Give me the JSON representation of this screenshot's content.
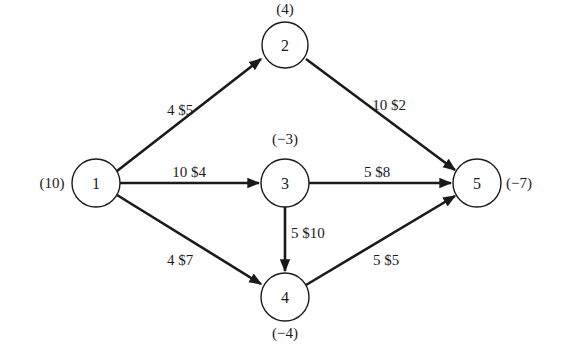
{
  "diagram": {
    "type": "network-flow",
    "nodes": [
      {
        "id": "1",
        "label": "1",
        "supply": "(10)",
        "x": 96,
        "y": 183
      },
      {
        "id": "2",
        "label": "2",
        "supply": "(4)",
        "x": 285,
        "y": 45
      },
      {
        "id": "3",
        "label": "3",
        "supply": "(−3)",
        "x": 285,
        "y": 183
      },
      {
        "id": "4",
        "label": "4",
        "supply": "(−4)",
        "x": 285,
        "y": 297
      },
      {
        "id": "5",
        "label": "5",
        "supply": "(−7)",
        "x": 477,
        "y": 183
      }
    ],
    "edges": [
      {
        "from": "1",
        "to": "2",
        "label": "4 $5",
        "capacity": 4,
        "cost": 5
      },
      {
        "from": "1",
        "to": "3",
        "label": "10 $4",
        "capacity": 10,
        "cost": 4
      },
      {
        "from": "1",
        "to": "4",
        "label": "4 $7",
        "capacity": 4,
        "cost": 7
      },
      {
        "from": "2",
        "to": "5",
        "label": "10 $2",
        "capacity": 10,
        "cost": 2
      },
      {
        "from": "3",
        "to": "5",
        "label": "5 $8",
        "capacity": 5,
        "cost": 8
      },
      {
        "from": "3",
        "to": "4",
        "label": "5 $10",
        "capacity": 5,
        "cost": 10
      },
      {
        "from": "4",
        "to": "5",
        "label": "5 $5",
        "capacity": 5,
        "cost": 5
      }
    ]
  },
  "labels": {
    "n1": "1",
    "n2": "2",
    "n3": "3",
    "n4": "4",
    "n5": "5",
    "s1": "(10)",
    "s2": "(4)",
    "s3": "(−3)",
    "s4": "(−4)",
    "s5": "(−7)",
    "e12": "4 $5",
    "e13": "10 $4",
    "e14": "4 $7",
    "e25": "10 $2",
    "e35": "5 $8",
    "e34": "5 $10",
    "e45": "5 $5"
  }
}
